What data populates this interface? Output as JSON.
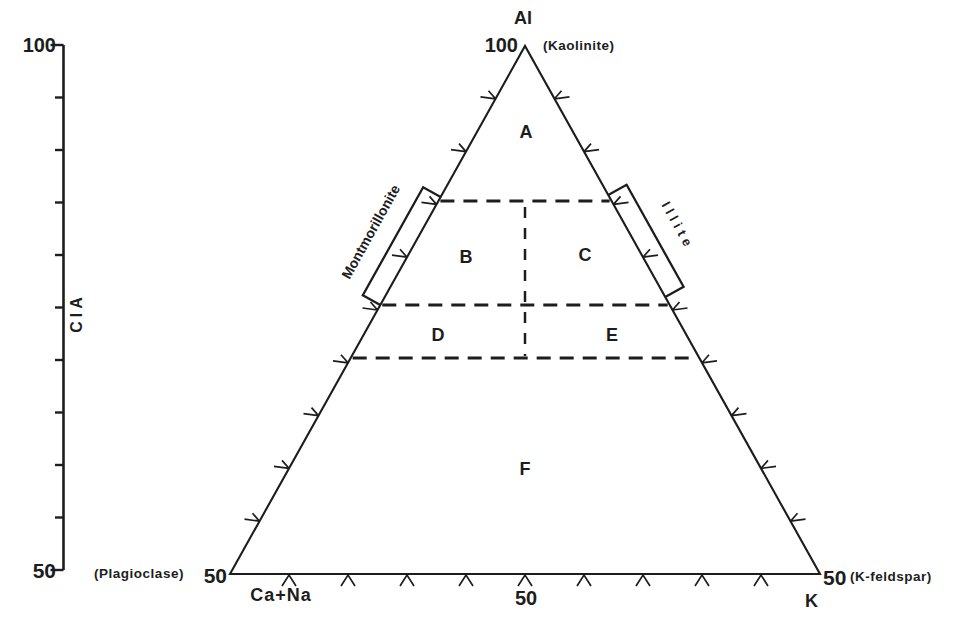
{
  "figure": {
    "background": "#ffffff",
    "ink": "#1d1d1d",
    "type": "ternary-diagram"
  },
  "axis": {
    "label": "CIA",
    "top_value": "100",
    "bottom_value": "50",
    "tick_count": 11
  },
  "apex": {
    "element": "Al",
    "value": "100",
    "mineral": "(Kaolinite)"
  },
  "left_vertex": {
    "mineral": "(Plagioclase)",
    "value": "50",
    "element": "Ca+Na"
  },
  "right_vertex": {
    "value": "50",
    "mineral": "(K-feldspar)",
    "element": "K"
  },
  "base_center_value": "50",
  "edge_ticks_per_side": 9,
  "regions": [
    {
      "label": "A"
    },
    {
      "label": "B"
    },
    {
      "label": "C"
    },
    {
      "label": "D"
    },
    {
      "label": "E"
    },
    {
      "label": "F"
    }
  ],
  "annotations": [
    {
      "label": "Montmorillonite",
      "side": "left-slope"
    },
    {
      "label": "Illite",
      "side": "right-slope"
    }
  ],
  "dashed_boundaries": {
    "horizontal_cia_levels": [
      85,
      75,
      70
    ],
    "vertical_split_at_base_percent": 50
  }
}
